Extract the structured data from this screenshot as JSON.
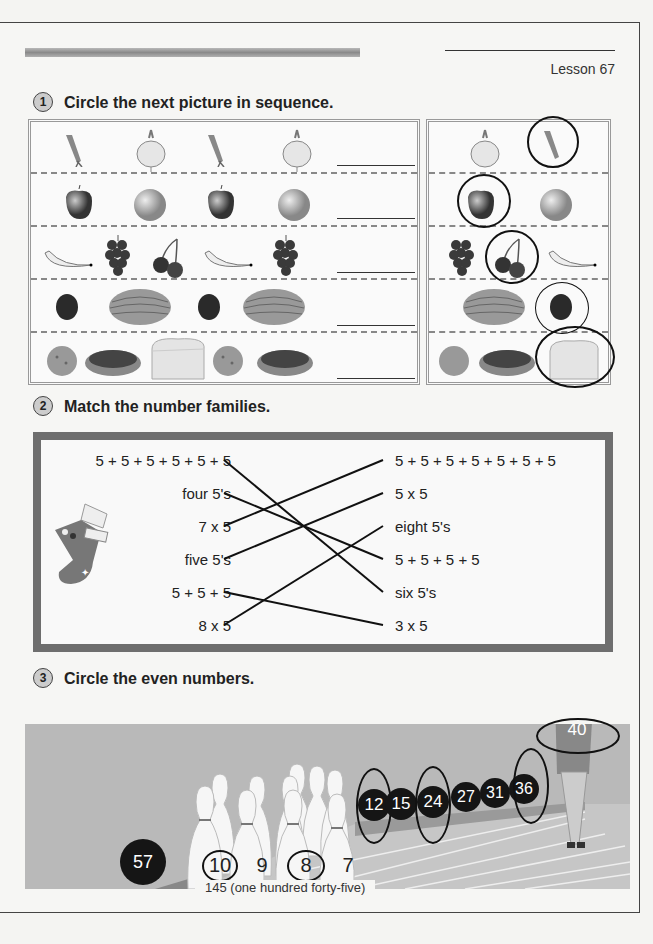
{
  "header": {
    "lesson_label": "Lesson 67"
  },
  "section1": {
    "number": "1",
    "title": "Circle the next picture in sequence.",
    "rows": [
      {
        "sequence": [
          "carrot",
          "turnip",
          "carrot",
          "turnip"
        ],
        "choices": [
          "turnip",
          "carrot"
        ],
        "circled": "carrot"
      },
      {
        "sequence": [
          "apple",
          "orange",
          "apple",
          "orange"
        ],
        "choices": [
          "apple",
          "orange"
        ],
        "circled": "apple"
      },
      {
        "sequence": [
          "banana",
          "grapes",
          "cherries",
          "banana",
          "grapes"
        ],
        "choices": [
          "grapes",
          "cherries",
          "banana"
        ],
        "circled": "cherries"
      },
      {
        "sequence": [
          "plum",
          "melon",
          "plum",
          "melon"
        ],
        "choices": [
          "melon",
          "plum"
        ],
        "circled": "plum"
      },
      {
        "sequence": [
          "cookie",
          "donut",
          "bread",
          "cookie",
          "donut"
        ],
        "choices": [
          "cookie",
          "donut",
          "bread"
        ],
        "circled": "bread"
      }
    ]
  },
  "section2": {
    "number": "2",
    "title": "Match the number families.",
    "left": [
      "5 + 5 + 5 + 5 + 5 + 5",
      "four 5's",
      "7 x 5",
      "five 5's",
      "5 + 5 + 5",
      "8 x 5"
    ],
    "right": [
      "5 + 5 + 5 + 5 + 5 + 5 + 5",
      "5 x 5",
      "eight 5's",
      "5 + 5 + 5 + 5",
      "six 5's",
      "3 x 5"
    ],
    "matches": [
      [
        0,
        4
      ],
      [
        1,
        3
      ],
      [
        2,
        0
      ],
      [
        3,
        1
      ],
      [
        4,
        5
      ],
      [
        5,
        2
      ]
    ]
  },
  "section3": {
    "number": "3",
    "title": "Circle the even numbers.",
    "pins": [
      {
        "value": "10",
        "circled": true
      },
      {
        "value": "9",
        "circled": false
      },
      {
        "value": "8",
        "circled": true
      },
      {
        "value": "7",
        "circled": false
      }
    ],
    "balls": [
      {
        "value": "57",
        "circled": false
      },
      {
        "value": "12",
        "circled": true
      },
      {
        "value": "15",
        "circled": false
      },
      {
        "value": "24",
        "circled": true
      },
      {
        "value": "27",
        "circled": false
      },
      {
        "value": "31",
        "circled": false
      },
      {
        "value": "36",
        "circled": true
      }
    ],
    "bowler_shirt": {
      "value": "40",
      "circled": true
    }
  },
  "footer": {
    "page_label": "145 (one hundred forty-five)"
  }
}
